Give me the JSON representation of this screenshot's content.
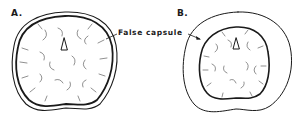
{
  "figure": {
    "panels": [
      {
        "id": "A",
        "label": "A."
      },
      {
        "id": "B",
        "label": "B."
      }
    ],
    "callout": {
      "label": "False capsule",
      "points_to": [
        "A",
        "B"
      ]
    },
    "colors": {
      "ink": "#1a1a1a",
      "background": "#ffffff"
    }
  }
}
